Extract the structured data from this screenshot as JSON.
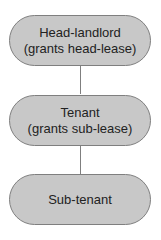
{
  "diagram": {
    "nodes": [
      {
        "line1": "Head-landlord",
        "line2": "(grants head-lease)"
      },
      {
        "line1": "Tenant",
        "line2": "(grants sub-lease)"
      },
      {
        "line1": "Sub-tenant",
        "line2": ""
      }
    ],
    "edges": [
      {
        "from": "Head-landlord",
        "to": "Tenant"
      },
      {
        "from": "Tenant",
        "to": "Sub-tenant"
      }
    ],
    "colors": {
      "fill": "#c8c8c8",
      "border": "#7f7f7f",
      "text": "#222222"
    }
  }
}
